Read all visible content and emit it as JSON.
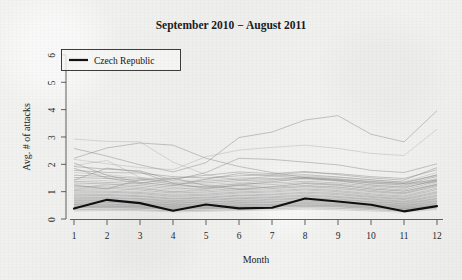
{
  "chart_data": {
    "type": "line",
    "title": "September 2010 − August 2011",
    "xlabel": "Month",
    "ylabel": "Avg. # of attacks",
    "xlim": [
      1,
      12
    ],
    "ylim": [
      0,
      6.4
    ],
    "x": [
      1,
      2,
      3,
      4,
      5,
      6,
      7,
      8,
      9,
      10,
      11,
      12
    ],
    "xticks": [
      "1",
      "2",
      "3",
      "4",
      "5",
      "6",
      "7",
      "8",
      "9",
      "10",
      "11",
      "12"
    ],
    "yticks": [
      "0",
      "1",
      "2",
      "3",
      "4",
      "5",
      "6"
    ],
    "grid": false,
    "legend_position": "top-left",
    "legend": [
      {
        "label": "Czech Republic",
        "color": "#111111",
        "style": "bold-line"
      }
    ],
    "highlight_series": {
      "name": "Czech Republic",
      "color": "#111111",
      "values": [
        0.38,
        0.7,
        0.58,
        0.3,
        0.53,
        0.39,
        0.41,
        0.75,
        0.64,
        0.52,
        0.28,
        0.47
      ]
    },
    "background_series_note": "Unlabelled grey country series plotted behind the highlighted line",
    "series": [
      {
        "name": "bg-01",
        "values": [
          2.92,
          2.84,
          2.82,
          2.08,
          1.62,
          1.42,
          1.58,
          1.48,
          1.4,
          1.32,
          1.28,
          1.35
        ]
      },
      {
        "name": "bg-02",
        "values": [
          2.22,
          2.6,
          2.78,
          2.7,
          2.22,
          1.92,
          1.7,
          1.52,
          1.44,
          1.36,
          1.3,
          1.42
        ]
      },
      {
        "name": "bg-03",
        "values": [
          2.58,
          2.3,
          1.98,
          1.72,
          2.06,
          2.98,
          3.18,
          3.62,
          3.78,
          3.1,
          2.82,
          3.96
        ]
      },
      {
        "name": "bg-04",
        "values": [
          2.18,
          2.02,
          1.88,
          1.8,
          2.28,
          2.52,
          2.62,
          2.7,
          2.58,
          2.4,
          2.32,
          3.28
        ]
      },
      {
        "name": "bg-05",
        "values": [
          1.92,
          1.82,
          1.76,
          1.42,
          1.7,
          2.22,
          2.18,
          2.08,
          1.98,
          1.78,
          1.7,
          2.02
        ]
      },
      {
        "name": "bg-06",
        "values": [
          1.78,
          1.7,
          1.68,
          1.55,
          1.5,
          1.58,
          1.62,
          1.7,
          1.66,
          1.55,
          1.48,
          1.8
        ]
      },
      {
        "name": "bg-07",
        "values": [
          1.7,
          1.62,
          1.52,
          1.4,
          1.44,
          1.5,
          1.54,
          1.58,
          1.52,
          1.42,
          1.36,
          1.7
        ]
      },
      {
        "name": "bg-08",
        "values": [
          1.6,
          1.55,
          1.48,
          1.34,
          1.38,
          1.46,
          1.48,
          1.52,
          1.46,
          1.38,
          1.3,
          1.62
        ]
      },
      {
        "name": "bg-09",
        "values": [
          1.52,
          1.48,
          1.42,
          1.28,
          1.32,
          1.4,
          1.44,
          1.48,
          1.42,
          1.32,
          1.24,
          1.56
        ]
      },
      {
        "name": "bg-10",
        "values": [
          1.45,
          1.4,
          1.34,
          1.22,
          1.26,
          1.34,
          1.38,
          1.44,
          1.38,
          1.26,
          1.18,
          1.5
        ]
      },
      {
        "name": "bg-11",
        "values": [
          1.38,
          1.34,
          1.28,
          1.16,
          1.2,
          1.28,
          1.32,
          1.38,
          1.32,
          1.2,
          1.12,
          1.44
        ]
      },
      {
        "name": "bg-12",
        "values": [
          1.32,
          1.28,
          1.22,
          1.1,
          1.14,
          1.22,
          1.26,
          1.33,
          1.27,
          1.15,
          1.06,
          1.38
        ]
      },
      {
        "name": "bg-13",
        "values": [
          1.26,
          1.22,
          1.16,
          1.05,
          1.09,
          1.17,
          1.21,
          1.28,
          1.22,
          1.1,
          1.01,
          1.33
        ]
      },
      {
        "name": "bg-14",
        "values": [
          1.2,
          1.17,
          1.11,
          1.0,
          1.04,
          1.12,
          1.16,
          1.23,
          1.17,
          1.05,
          0.96,
          1.28
        ]
      },
      {
        "name": "bg-15",
        "values": [
          1.14,
          1.12,
          1.06,
          0.95,
          0.99,
          1.07,
          1.11,
          1.18,
          1.12,
          1.0,
          0.92,
          1.23
        ]
      },
      {
        "name": "bg-16",
        "values": [
          1.09,
          1.07,
          1.01,
          0.91,
          0.95,
          1.03,
          1.07,
          1.14,
          1.08,
          0.96,
          0.88,
          1.18
        ]
      },
      {
        "name": "bg-17",
        "values": [
          1.04,
          1.02,
          0.97,
          0.87,
          0.91,
          0.99,
          1.03,
          1.1,
          1.04,
          0.92,
          0.84,
          1.13
        ]
      },
      {
        "name": "bg-18",
        "values": [
          0.99,
          0.98,
          0.93,
          0.83,
          0.87,
          0.95,
          0.99,
          1.06,
          1.0,
          0.88,
          0.8,
          1.08
        ]
      },
      {
        "name": "bg-19",
        "values": [
          0.95,
          0.94,
          0.89,
          0.8,
          0.84,
          0.91,
          0.95,
          1.02,
          0.96,
          0.85,
          0.77,
          1.03
        ]
      },
      {
        "name": "bg-20",
        "values": [
          0.91,
          0.9,
          0.85,
          0.76,
          0.8,
          0.87,
          0.91,
          0.98,
          0.93,
          0.82,
          0.74,
          0.99
        ]
      },
      {
        "name": "bg-21",
        "values": [
          0.87,
          0.86,
          0.82,
          0.73,
          0.77,
          0.84,
          0.88,
          0.94,
          0.89,
          0.79,
          0.71,
          0.95
        ]
      },
      {
        "name": "bg-22",
        "values": [
          0.83,
          0.83,
          0.78,
          0.7,
          0.74,
          0.8,
          0.84,
          0.9,
          0.85,
          0.76,
          0.68,
          0.91
        ]
      },
      {
        "name": "bg-23",
        "values": [
          0.8,
          0.79,
          0.75,
          0.67,
          0.71,
          0.77,
          0.81,
          0.87,
          0.82,
          0.73,
          0.65,
          0.87
        ]
      },
      {
        "name": "bg-24",
        "values": [
          0.76,
          0.76,
          0.72,
          0.64,
          0.68,
          0.74,
          0.78,
          0.83,
          0.79,
          0.7,
          0.62,
          0.83
        ]
      },
      {
        "name": "bg-25",
        "values": [
          0.73,
          0.73,
          0.69,
          0.62,
          0.65,
          0.71,
          0.75,
          0.8,
          0.76,
          0.67,
          0.6,
          0.8
        ]
      },
      {
        "name": "bg-26",
        "values": [
          0.7,
          0.7,
          0.66,
          0.59,
          0.62,
          0.68,
          0.72,
          0.77,
          0.73,
          0.64,
          0.57,
          0.76
        ]
      },
      {
        "name": "bg-27",
        "values": [
          0.67,
          0.67,
          0.63,
          0.57,
          0.6,
          0.65,
          0.69,
          0.74,
          0.7,
          0.62,
          0.55,
          0.73
        ]
      },
      {
        "name": "bg-28",
        "values": [
          0.64,
          0.64,
          0.61,
          0.54,
          0.57,
          0.62,
          0.66,
          0.71,
          0.67,
          0.59,
          0.52,
          0.7
        ]
      },
      {
        "name": "bg-29",
        "values": [
          0.61,
          0.61,
          0.58,
          0.52,
          0.55,
          0.6,
          0.63,
          0.68,
          0.64,
          0.57,
          0.5,
          0.67
        ]
      },
      {
        "name": "bg-30",
        "values": [
          0.58,
          0.59,
          0.56,
          0.5,
          0.52,
          0.57,
          0.61,
          0.65,
          0.62,
          0.54,
          0.48,
          0.64
        ]
      },
      {
        "name": "bg-31",
        "values": [
          0.56,
          0.56,
          0.53,
          0.48,
          0.5,
          0.55,
          0.58,
          0.62,
          0.59,
          0.52,
          0.46,
          0.61
        ]
      },
      {
        "name": "bg-32",
        "values": [
          0.53,
          0.54,
          0.51,
          0.46,
          0.48,
          0.52,
          0.55,
          0.6,
          0.57,
          0.5,
          0.44,
          0.58
        ]
      },
      {
        "name": "bg-33",
        "values": [
          0.51,
          0.51,
          0.49,
          0.44,
          0.46,
          0.5,
          0.53,
          0.57,
          0.54,
          0.48,
          0.42,
          0.56
        ]
      },
      {
        "name": "bg-34",
        "values": [
          0.48,
          0.49,
          0.47,
          0.42,
          0.44,
          0.48,
          0.51,
          0.55,
          0.52,
          0.46,
          0.4,
          0.53
        ]
      },
      {
        "name": "bg-35",
        "values": [
          0.46,
          0.47,
          0.45,
          0.4,
          0.42,
          0.46,
          0.49,
          0.52,
          0.5,
          0.44,
          0.38,
          0.51
        ]
      },
      {
        "name": "bg-36",
        "values": [
          0.44,
          0.45,
          0.43,
          0.38,
          0.4,
          0.44,
          0.47,
          0.5,
          0.48,
          0.42,
          0.37,
          0.49
        ]
      },
      {
        "name": "bg-37",
        "values": [
          0.42,
          0.43,
          0.41,
          0.36,
          0.38,
          0.42,
          0.45,
          0.48,
          0.46,
          0.4,
          0.35,
          0.47
        ]
      },
      {
        "name": "bg-38",
        "values": [
          0.4,
          0.41,
          0.39,
          0.35,
          0.37,
          0.4,
          0.43,
          0.46,
          0.44,
          0.38,
          0.34,
          0.45
        ]
      },
      {
        "name": "bg-39",
        "values": [
          0.34,
          0.36,
          0.34,
          0.3,
          0.32,
          0.35,
          0.38,
          0.41,
          0.39,
          0.34,
          0.29,
          0.4
        ]
      },
      {
        "name": "bg-40",
        "values": [
          0.29,
          0.31,
          0.3,
          0.26,
          0.28,
          0.31,
          0.33,
          0.36,
          0.34,
          0.29,
          0.25,
          0.35
        ]
      },
      {
        "name": "bg-41",
        "values": [
          1.85,
          1.5,
          1.3,
          1.48,
          1.6,
          1.72,
          1.66,
          1.74,
          1.62,
          1.5,
          1.42,
          1.88
        ]
      },
      {
        "name": "bg-42",
        "values": [
          2.05,
          1.6,
          1.34,
          1.22,
          1.46,
          1.66,
          1.58,
          1.62,
          1.54,
          1.44,
          1.34,
          1.6
        ]
      },
      {
        "name": "bg-43",
        "values": [
          1.96,
          2.14,
          1.52,
          1.26,
          1.18,
          1.3,
          1.42,
          1.56,
          1.48,
          1.3,
          1.22,
          1.46
        ]
      },
      {
        "name": "bg-44",
        "values": [
          1.42,
          1.86,
          1.72,
          1.3,
          1.12,
          1.24,
          1.36,
          1.5,
          1.4,
          1.24,
          1.16,
          1.4
        ]
      },
      {
        "name": "bg-45",
        "values": [
          1.24,
          1.1,
          1.44,
          1.5,
          1.22,
          1.08,
          1.18,
          1.3,
          1.24,
          1.1,
          1.02,
          1.26
        ]
      },
      {
        "name": "bg-46",
        "values": [
          1.06,
          1.28,
          1.16,
          0.98,
          1.1,
          1.24,
          1.12,
          1.2,
          1.16,
          1.02,
          0.94,
          1.2
        ]
      }
    ]
  },
  "axes": {
    "ylabel": "Avg. # of attacks",
    "xlabel": "Month"
  },
  "legend": {
    "czech_label": "Czech Republic"
  }
}
